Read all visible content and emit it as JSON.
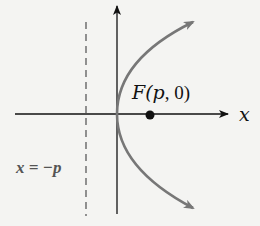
{
  "diagram": {
    "focus_label": {
      "prefix": "F(",
      "var": "p",
      "sep": ", ",
      "zero": "0",
      "suffix": ")"
    },
    "x_axis_label": "x",
    "directrix_label": "x = −p",
    "colors": {
      "axis": "#111111",
      "curve": "#777777",
      "directrix": "#777777",
      "focus": "#111111",
      "background": "#f4f4f2"
    }
  }
}
